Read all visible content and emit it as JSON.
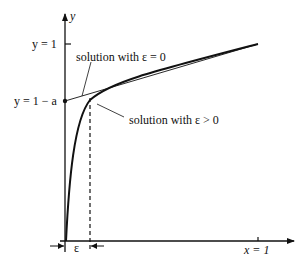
{
  "diagram": {
    "axes": {
      "y_label": "y",
      "x_tick_label": "x = 1",
      "y_tick_top_label": "y = 1",
      "y_tick_mid_label": "y = 1 − a"
    },
    "annotations": {
      "eps_zero": "solution with ε = 0",
      "eps_pos": "solution with ε > 0",
      "eps_width": "ε"
    },
    "colors": {
      "line": "#111111",
      "background": "#ffffff"
    }
  }
}
